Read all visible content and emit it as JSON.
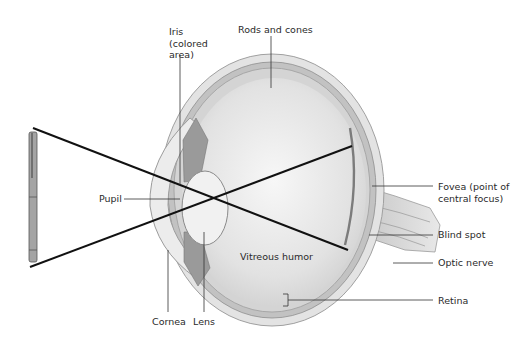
{
  "diagram": {
    "title": "",
    "labels": {
      "iris": "Iris\n(colored\narea)",
      "rods_cones": "Rods and cones",
      "pupil": "Pupil",
      "fovea": "Fovea (point of\ncentral focus)",
      "blind_spot": "Blind spot",
      "optic_nerve": "Optic nerve",
      "vitreous": "Vitreous humor",
      "retina": "Retina",
      "cornea": "Cornea",
      "lens": "Lens"
    },
    "colors": {
      "background": "#ffffff",
      "eye_fill": "#e6e6e6",
      "sclera": "#c9c9c9",
      "choroid": "#a8a8a8",
      "ray": "#111111",
      "leader": "#333333",
      "text": "#2a2a2a"
    }
  }
}
